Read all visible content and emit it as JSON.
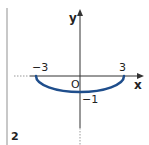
{
  "panel": {
    "number": "2"
  },
  "axes": {
    "x_label": "x",
    "y_label": "y",
    "origin_label": "O"
  },
  "ticks": {
    "x_left": "−3",
    "x_right": "3",
    "y_bottom": "−1"
  },
  "curve": {
    "description": "lower semi-ellipse from (-3,0) to (3,0) passing through (0,-1)",
    "color": "#1f4e8c",
    "endpoints": [
      [
        -3,
        0
      ],
      [
        3,
        0
      ]
    ],
    "vertex": [
      0,
      -1
    ]
  }
}
